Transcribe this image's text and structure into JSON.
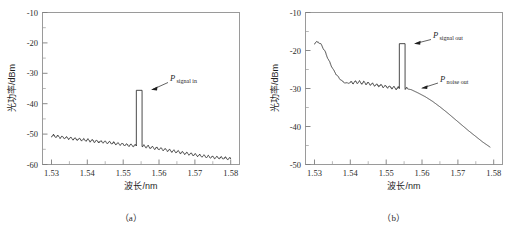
{
  "figure": {
    "panels": [
      {
        "id": "a",
        "caption": "（a）",
        "xlabel": "波长/nm",
        "ylabel": "光功率/dBm"
      },
      {
        "id": "b",
        "caption": "（b）",
        "xlabel": "波长/nm",
        "ylabel": "光功率/dBm"
      }
    ]
  },
  "chart_data": [
    {
      "type": "line",
      "panel": "a",
      "title": "",
      "xlabel": "波长/nm",
      "ylabel": "光功率/dBm",
      "xlim": [
        1.5275,
        1.5825
      ],
      "ylim": [
        -60,
        -10
      ],
      "xticks": [
        1.53,
        1.54,
        1.55,
        1.56,
        1.57,
        1.58
      ],
      "xtick_labels": [
        "1.53",
        "1.54",
        "1.55",
        "1.56",
        "1.57",
        "1.58"
      ],
      "yticks": [
        -60,
        -50,
        -40,
        -30,
        -20,
        -10
      ],
      "ytick_labels": [
        "-60",
        "-50",
        "-40",
        "-30",
        "-20",
        "-10"
      ],
      "minor_ticks": true,
      "grid": false,
      "legend": null,
      "annotations": [
        {
          "text_main": "P",
          "text_sub": "signal in",
          "points_to_x": 1.5545,
          "points_to_y": -35.6,
          "label_x": 1.5605,
          "label_y": -32.2
        }
      ],
      "series": [
        {
          "name": "input-spectrum",
          "description": "ASE noise floor with sawtooth ripple plus narrow signal spike at 1.5545 um",
          "noise_floor_start_dbm": -50.5,
          "noise_floor_at_peak_dbm": -54.0,
          "noise_floor_end_dbm": -58.0,
          "ripple_amplitude_db": 0.9,
          "ripple_period_nm": 0.0012,
          "peak_wavelength": 1.5545,
          "peak_top_dbm": -35.6,
          "peak_width_nm": 0.0016,
          "x": [
            1.53,
            1.532,
            1.534,
            1.536,
            1.538,
            1.54,
            1.542,
            1.544,
            1.546,
            1.548,
            1.55,
            1.552,
            1.5537,
            1.5545,
            1.5553,
            1.557,
            1.559,
            1.561,
            1.563,
            1.565,
            1.567,
            1.569,
            1.571,
            1.573,
            1.575,
            1.577,
            1.579,
            1.58
          ],
          "y": [
            -50.5,
            -50.9,
            -51.2,
            -51.5,
            -51.8,
            -52.0,
            -52.3,
            -52.5,
            -52.8,
            -53.1,
            -53.4,
            -53.7,
            -53.9,
            -35.6,
            -53.9,
            -54.2,
            -54.6,
            -55.0,
            -55.4,
            -55.8,
            -56.2,
            -56.6,
            -57.0,
            -57.3,
            -57.6,
            -57.8,
            -58.0,
            -58.1
          ]
        }
      ]
    },
    {
      "type": "line",
      "panel": "b",
      "title": "",
      "xlabel": "波长/nm",
      "ylabel": "光功率/dBm",
      "xlim": [
        1.5275,
        1.5825
      ],
      "ylim": [
        -50,
        -10
      ],
      "xticks": [
        1.53,
        1.54,
        1.55,
        1.56,
        1.57,
        1.58
      ],
      "xtick_labels": [
        "1.53",
        "1.54",
        "1.55",
        "1.56",
        "1.57",
        "1.58"
      ],
      "yticks": [
        -50,
        -40,
        -30,
        -20,
        -10
      ],
      "ytick_labels": [
        "-50",
        "-40",
        "-30",
        "-20",
        "-10"
      ],
      "minor_ticks": true,
      "grid": false,
      "legend": null,
      "annotations": [
        {
          "text_main": "P",
          "text_sub": "signal out",
          "points_to_x": 1.5545,
          "points_to_y": -18.2,
          "label_x": 1.5625,
          "label_y": -17.4
        },
        {
          "text_main": "P",
          "text_sub": "noise out",
          "points_to_x": 1.556,
          "points_to_y": -30.2,
          "label_x": 1.564,
          "label_y": -28.2
        }
      ],
      "series": [
        {
          "name": "output-spectrum",
          "description": "Amplified ASE with gain roll-off, ripple plateau, signal spike at 1.5545 um, long-wavelength decay",
          "start_dbm": -18.1,
          "dip_dbm": -28.6,
          "plateau_dbm": -29.6,
          "end_dbm": -45.5,
          "ripple_amplitude_db": 0.8,
          "peak_wavelength": 1.5545,
          "peak_top_dbm": -18.2,
          "peak_width_nm": 0.0016,
          "x": [
            1.53,
            1.531,
            1.532,
            1.533,
            1.534,
            1.535,
            1.536,
            1.537,
            1.538,
            1.539,
            1.54,
            1.542,
            1.544,
            1.546,
            1.548,
            1.55,
            1.552,
            1.5537,
            1.5545,
            1.5553,
            1.557,
            1.559,
            1.561,
            1.563,
            1.565,
            1.567,
            1.569,
            1.571,
            1.573,
            1.575,
            1.577,
            1.579
          ],
          "y": [
            -18.1,
            -17.7,
            -18.6,
            -20.4,
            -22.6,
            -24.6,
            -26.2,
            -27.4,
            -28.3,
            -28.6,
            -28.5,
            -28.3,
            -28.5,
            -28.9,
            -29.2,
            -29.5,
            -29.8,
            -30.0,
            -18.2,
            -30.0,
            -30.3,
            -31.2,
            -32.2,
            -33.4,
            -34.8,
            -36.3,
            -37.9,
            -39.5,
            -41.1,
            -42.6,
            -44.1,
            -45.4
          ]
        }
      ]
    }
  ]
}
